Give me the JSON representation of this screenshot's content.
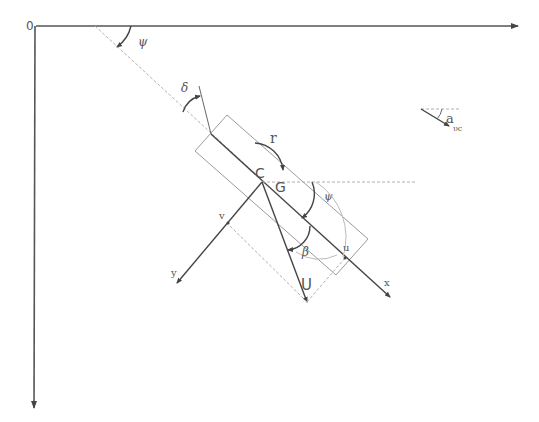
{
  "diagram": {
    "type": "ship maneuvering kinematics diagram",
    "colors": {
      "stroke": "#444444",
      "light_stroke": "#b0b0b0",
      "background": "#ffffff"
    },
    "labels": {
      "origin": "0",
      "heading_angle_top": "ψ",
      "rudder_angle": "δ",
      "yaw_rate": "r",
      "center_point": "C",
      "gravity_center": "G",
      "heading_angle_local": "ψ",
      "drift_angle": "β",
      "surge_velocity": "u",
      "sway_velocity": "v",
      "total_velocity": "U",
      "body_x_axis": "x",
      "body_y_axis": "y",
      "current_angle": "a",
      "current_velocity": "υc"
    }
  }
}
